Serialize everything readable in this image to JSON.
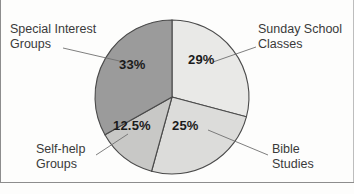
{
  "chart_data": {
    "type": "pie",
    "title": "",
    "subtitle": "",
    "xlabel": "",
    "ylabel": "",
    "legend_position": "callout-labels",
    "grid": false,
    "start_angle_deg": 0,
    "direction": "clockwise",
    "categories": [
      "Sunday School Classes",
      "Bible Studies",
      "Self-help Groups",
      "Special Interest Groups"
    ],
    "values": [
      29,
      25,
      12.5,
      33
    ],
    "value_labels": [
      "29%",
      "25%",
      "12.5%",
      "33%"
    ],
    "colors": [
      "#e9e9e7",
      "#dcdcda",
      "#c8c8c6",
      "#9b9b9b"
    ],
    "slices": [
      {
        "label": "Sunday School Classes",
        "value": 29,
        "value_label": "29%",
        "color": "#e9e9e7",
        "start_deg": 0,
        "end_deg": 104.4
      },
      {
        "label": "Bible Studies",
        "value": 25,
        "value_label": "25%",
        "color": "#dcdcda",
        "start_deg": 104.4,
        "end_deg": 194.4
      },
      {
        "label": "Self-help Groups",
        "value": 12.5,
        "value_label": "12.5%",
        "color": "#c8c8c6",
        "start_deg": 194.4,
        "end_deg": 239.4
      },
      {
        "label": "Special Interest Groups",
        "value": 33,
        "value_label": "33%",
        "color": "#9b9b9b",
        "start_deg": 239.4,
        "end_deg": 360
      }
    ]
  },
  "callouts": {
    "special_interest": {
      "line1": "Special Interest",
      "line2": "Groups"
    },
    "sunday_school": {
      "line1": "Sunday School",
      "line2": "Classes"
    },
    "self_help": {
      "line1": "Self-help",
      "line2": "Groups"
    },
    "bible_studies": {
      "line1": "Bible",
      "line2": "Studies"
    }
  },
  "percent_labels": {
    "sunday_school": "29%",
    "bible_studies": "25%",
    "self_help": "12.5%",
    "special_interest": "33%"
  },
  "style": {
    "slice_outline": "#4a4a4a",
    "leader_line": "#6f6f6f",
    "frame_line": "#8d8d8d",
    "text_color": "#3a3a3a",
    "percent_text_color": "#1b1b1b",
    "background": "#fdfdfc"
  }
}
